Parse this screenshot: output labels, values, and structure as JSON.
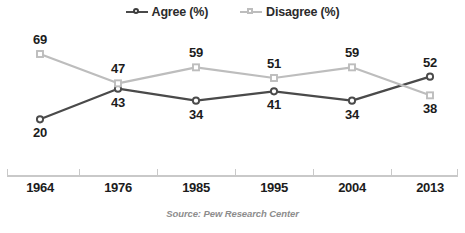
{
  "legend": {
    "items": [
      {
        "label": "Agree (%)",
        "marker": "circle-marker-icon",
        "color": "#4a4a4a"
      },
      {
        "label": "Disagree (%)",
        "marker": "square-marker-icon",
        "color": "#bdbdbd"
      }
    ]
  },
  "source": {
    "text": "Source: Pew Research Center"
  },
  "chart_data": {
    "type": "line",
    "title": "",
    "xlabel": "",
    "ylabel": "",
    "grid": false,
    "legend_position": "top-center",
    "categories": [
      "1964",
      "1976",
      "1985",
      "1995",
      "2004",
      "2013"
    ],
    "ylim": [
      15,
      72
    ],
    "series": [
      {
        "name": "Agree (%)",
        "color": "#4a4a4a",
        "marker": "circle",
        "values": [
          20,
          43,
          34,
          41,
          34,
          52
        ],
        "label_positions": [
          "below",
          "below",
          "below",
          "below",
          "below",
          "above"
        ]
      },
      {
        "name": "Disagree (%)",
        "color": "#bdbdbd",
        "marker": "square",
        "values": [
          69,
          47,
          59,
          51,
          59,
          38
        ],
        "label_positions": [
          "above",
          "above",
          "above",
          "above",
          "above",
          "below"
        ]
      }
    ]
  }
}
